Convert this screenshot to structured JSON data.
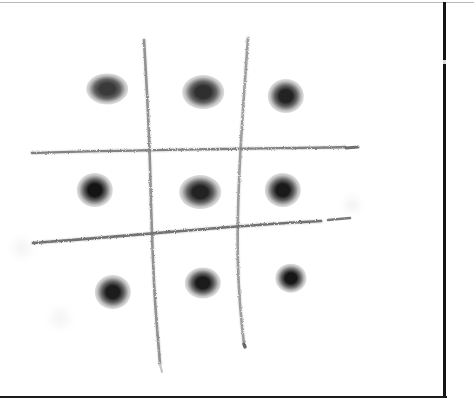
{
  "page": {
    "title": "Scanned hand-drawn 3x3 dot grid",
    "background_color": "#ffffff",
    "width": 474,
    "height": 408,
    "caption": ""
  },
  "borders": {
    "top": {
      "color": "#b9b9b9",
      "x": 0,
      "y": 2,
      "length": 474,
      "thickness": 1
    },
    "right": {
      "color": "#141414",
      "x": 443,
      "y": 2,
      "length": 396,
      "thickness": 3
    },
    "bottom": {
      "color": "#1b1b1b",
      "x": 0,
      "y": 396,
      "length": 447,
      "thickness": 2
    }
  },
  "drawing": {
    "kind": "hand-drawn pencil grid with nine ink dots",
    "ink_color": "#8a8a8a",
    "dot_color": "#1a1a1a",
    "grid_lines": [
      {
        "name": "vertical-line-left",
        "orientation": "vertical",
        "color": "#8d8d8d",
        "stroke_width": 2.6,
        "path": "M 144 40 C 147 90, 149 130, 150 165 C 151 205, 152 250, 155 300 C 157 330, 159 350, 160 364"
      },
      {
        "name": "vertical-line-right",
        "orientation": "vertical",
        "color": "#9a9a9a",
        "stroke_width": 2.6,
        "path": "M 248 38 C 245 80, 242 120, 240 160 C 238 200, 237 230, 238 265 C 239 300, 242 328, 244 344"
      },
      {
        "name": "horizontal-line-top",
        "orientation": "horizontal",
        "color": "#7c7c7c",
        "stroke_width": 2.4,
        "path": "M 32 153 C 90 151, 160 150, 220 149 C 275 148, 320 148, 345 147"
      },
      {
        "name": "horizontal-line-bottom",
        "orientation": "horizontal",
        "color": "#6e6e6e",
        "stroke_width": 2.6,
        "path": "M 33 243 C 100 238, 170 232, 230 227 C 270 224, 300 222, 321 221"
      }
    ],
    "line_tails": [
      {
        "name": "horizontal-line-top-tail",
        "color": "#5f5f5f",
        "stroke_width": 3.0,
        "path": "M 346 148 L 358 147"
      },
      {
        "name": "horizontal-line-bottom-tail",
        "color": "#6b6b6b",
        "stroke_width": 2.6,
        "path": "M 328 220 L 350 218"
      },
      {
        "name": "vertical-line-left-tail",
        "color": "#c0c0c0",
        "stroke_width": 2.2,
        "path": "M 160 364 L 162 372"
      },
      {
        "name": "vertical-line-right-tail-dot",
        "color": "#5a5a5a",
        "stroke_width": 3.4,
        "path": "M 244 344 L 245 347"
      }
    ],
    "dots": [
      {
        "name": "dot-top-left",
        "row": 1,
        "col": 1,
        "cx": 107,
        "cy": 89,
        "rx": 16,
        "ry": 12,
        "darkness": "#3a3a3a"
      },
      {
        "name": "dot-top-center",
        "row": 1,
        "col": 2,
        "cx": 203,
        "cy": 92,
        "rx": 16,
        "ry": 13,
        "darkness": "#2f2f2f"
      },
      {
        "name": "dot-top-right",
        "row": 1,
        "col": 3,
        "cx": 286,
        "cy": 96,
        "rx": 14,
        "ry": 13,
        "darkness": "#232323"
      },
      {
        "name": "dot-middle-left",
        "row": 2,
        "col": 1,
        "cx": 95,
        "cy": 190,
        "rx": 14,
        "ry": 13,
        "darkness": "#141414"
      },
      {
        "name": "dot-middle-center",
        "row": 2,
        "col": 2,
        "cx": 200,
        "cy": 192,
        "rx": 16,
        "ry": 13,
        "darkness": "#222222"
      },
      {
        "name": "dot-middle-right",
        "row": 2,
        "col": 3,
        "cx": 283,
        "cy": 190,
        "rx": 14,
        "ry": 13,
        "darkness": "#1a1a1a"
      },
      {
        "name": "dot-bottom-left",
        "row": 3,
        "col": 1,
        "cx": 113,
        "cy": 292,
        "rx": 14,
        "ry": 13,
        "darkness": "#1c1c1c"
      },
      {
        "name": "dot-bottom-center",
        "row": 3,
        "col": 2,
        "cx": 203,
        "cy": 283,
        "rx": 14,
        "ry": 12,
        "darkness": "#1a1a1a"
      },
      {
        "name": "dot-bottom-right",
        "row": 3,
        "col": 3,
        "cx": 291,
        "cy": 278,
        "rx": 12,
        "ry": 11,
        "darkness": "#161616"
      }
    ],
    "smudges": [
      {
        "name": "smudge-right-margin",
        "cx": 352,
        "cy": 205,
        "r": 7,
        "opacity": 0.05
      },
      {
        "name": "smudge-left-margin",
        "cx": 22,
        "cy": 248,
        "r": 9,
        "opacity": 0.04
      },
      {
        "name": "smudge-bottom-left",
        "cx": 60,
        "cy": 318,
        "r": 10,
        "opacity": 0.035
      }
    ]
  }
}
